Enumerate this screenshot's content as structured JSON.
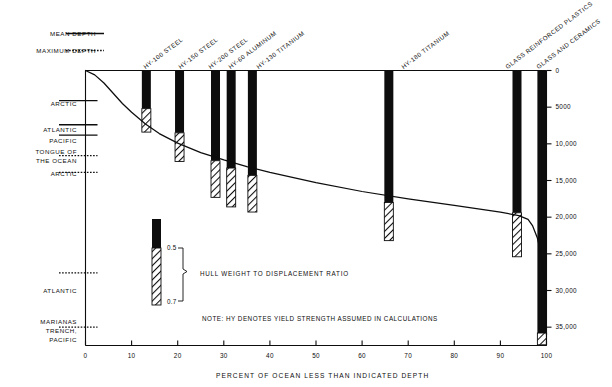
{
  "chart_data": {
    "type": "bar",
    "title": "",
    "xlabel": "PERCENT OF OCEAN LESS THAN INDICATED DEPTH",
    "ylabel": "",
    "x_ticks": [
      "0",
      "10",
      "20",
      "30",
      "40",
      "50",
      "60",
      "70",
      "80",
      "90",
      "100"
    ],
    "x_tick_values": [
      0,
      10,
      20,
      30,
      40,
      50,
      60,
      70,
      80,
      90,
      100
    ],
    "xlim": [
      0,
      100
    ],
    "y_ticks": [
      "0",
      "5000",
      "10,000",
      "15,000",
      "20,000",
      "25,000",
      "30,000",
      "35,000"
    ],
    "y_tick_values": [
      0,
      5000,
      10000,
      15000,
      20000,
      25000,
      30000,
      35000
    ],
    "ylim": [
      0,
      37500
    ],
    "y_axis_side": "right",
    "y_axis_units": "feet of depth",
    "grid": false,
    "legend_position": "top-left",
    "series": [
      {
        "name": "Ocean depth cumulative distribution curve",
        "type": "line",
        "x": [
          0,
          2,
          4,
          6,
          8,
          10,
          13,
          16,
          20,
          25,
          30,
          35,
          40,
          50,
          60,
          70,
          80,
          90,
          94,
          96,
          97,
          98,
          99,
          99.6,
          100
        ],
        "y": [
          0,
          600,
          1700,
          3100,
          4500,
          5700,
          7300,
          8600,
          9900,
          11200,
          12200,
          13100,
          13900,
          15300,
          16500,
          17500,
          18400,
          19300,
          19800,
          20300,
          21200,
          22800,
          25600,
          29000,
          36000
        ]
      }
    ],
    "bars": [
      {
        "label": "HY-100 STEEL",
        "x_percent": 13.2,
        "solid_top_ft": 0,
        "solid_bottom_ft": 5200,
        "hatch_top_ft": 5200,
        "hatch_bottom_ft": 8400,
        "ratio_top": 0.5,
        "ratio_bottom": 0.7
      },
      {
        "label": "HY-150 STEEL",
        "x_percent": 20.4,
        "solid_top_ft": 0,
        "solid_bottom_ft": 8500,
        "hatch_top_ft": 8500,
        "hatch_bottom_ft": 12400,
        "ratio_top": 0.5,
        "ratio_bottom": 0.7
      },
      {
        "label": "HY-200 STEEL",
        "x_percent": 28.2,
        "solid_top_ft": 0,
        "solid_bottom_ft": 12300,
        "hatch_top_ft": 12300,
        "hatch_bottom_ft": 17300,
        "ratio_top": 0.5,
        "ratio_bottom": 0.7
      },
      {
        "label": "HY-60 ALUMINUM",
        "x_percent": 31.6,
        "solid_top_ft": 0,
        "solid_bottom_ft": 13300,
        "hatch_top_ft": 13300,
        "hatch_bottom_ft": 18600,
        "ratio_top": 0.5,
        "ratio_bottom": 0.7
      },
      {
        "label": "HY-130 TITANIUM",
        "x_percent": 36.2,
        "solid_top_ft": 0,
        "solid_bottom_ft": 14300,
        "hatch_top_ft": 14300,
        "hatch_bottom_ft": 19300,
        "ratio_top": 0.5,
        "ratio_bottom": 0.7
      },
      {
        "label": "HY-180 TITANIUM",
        "x_percent": 65.8,
        "solid_top_ft": 0,
        "solid_bottom_ft": 18000,
        "hatch_top_ft": 18000,
        "hatch_bottom_ft": 23200,
        "ratio_top": 0.5,
        "ratio_bottom": 0.7
      },
      {
        "label": "GLASS REINFORCED PLASTICS",
        "x_percent": 93.6,
        "solid_top_ft": 0,
        "solid_bottom_ft": 19400,
        "hatch_top_ft": 19400,
        "hatch_bottom_ft": 25400,
        "ratio_top": 0.5,
        "ratio_bottom": 0.7
      },
      {
        "label": "GLASS AND CERAMICS",
        "x_percent": 99.0,
        "solid_top_ft": 0,
        "solid_bottom_ft": 35800,
        "hatch_top_ft": 35800,
        "hatch_bottom_ft": 37400,
        "ratio_top": 0.5,
        "ratio_bottom": 0.7
      }
    ],
    "depth_markers": [
      {
        "label": "ARCTIC",
        "depth_ft": 4100,
        "style": "mean"
      },
      {
        "label": "ATLANTIC",
        "depth_ft": 7400,
        "style": "mean"
      },
      {
        "label": "PACIFIC",
        "depth_ft": 8800,
        "style": "mean"
      },
      {
        "label": "TONGUE OF\nTHE OCEAN",
        "depth_ft": 11600,
        "style": "maximum"
      },
      {
        "label": "ARCTIC",
        "depth_ft": 13900,
        "style": "maximum"
      },
      {
        "label": "ATLANTIC",
        "depth_ft": 27600,
        "style": "maximum"
      },
      {
        "label": "MARIANAS\nTRENCH,\nPACIFIC",
        "depth_ft": 35000,
        "style": "maximum"
      }
    ],
    "annotations": [
      "NOTE: HY DENOTES YIELD STRENGTH ASSUMED IN CALCULATIONS",
      "HULL WEIGHT TO DISPLACEMENT RATIO"
    ]
  },
  "legend": {
    "mean_depth_label": "MEAN DEPTH",
    "maximum_depth_label": "MAXIMUM DEPTH"
  },
  "depth_labels": {
    "arctic_mean": "ARCTIC",
    "atlantic_mean": "ATLANTIC",
    "pacific_mean": "PACIFIC",
    "tongue_line1": "TONGUE OF",
    "tongue_line2": "THE OCEAN",
    "arctic_max": "ARCTIC",
    "atlantic_max": "ATLANTIC",
    "marianas_line1": "MARIANAS",
    "marianas_line2": "TRENCH,",
    "marianas_line3": "PACIFIC"
  },
  "bar_labels": {
    "b0": "HY-100 STEEL",
    "b1": "HY-150 STEEL",
    "b2": "HY-200 STEEL",
    "b3": "HY-60 ALUMINUM",
    "b4": "HY-130 TITANIUM",
    "b5": "HY-180 TITANIUM",
    "b6": "GLASS REINFORCED PLASTICS",
    "b7": "GLASS AND CERAMICS"
  },
  "x_axis": {
    "title": "PERCENT OF OCEAN LESS THAN INDICATED DEPTH",
    "t0": "0",
    "t1": "10",
    "t2": "20",
    "t3": "30",
    "t4": "40",
    "t5": "50",
    "t6": "60",
    "t7": "70",
    "t8": "80",
    "t9": "90",
    "t10": "100"
  },
  "y_axis": {
    "t0": "0",
    "t1": "5000",
    "t2": "10,000",
    "t3": "15,000",
    "t4": "20,000",
    "t5": "25,000",
    "t6": "30,000",
    "t7": "35,000"
  },
  "ratio_legend": {
    "top_value": "0.5",
    "bottom_value": "0.7",
    "caption": "HULL WEIGHT TO DISPLACEMENT RATIO"
  },
  "note": {
    "text": "NOTE: HY DENOTES YIELD STRENGTH ASSUMED IN CALCULATIONS"
  },
  "colors": {
    "ink": "#0d0d0d",
    "background": "#ffffff"
  }
}
